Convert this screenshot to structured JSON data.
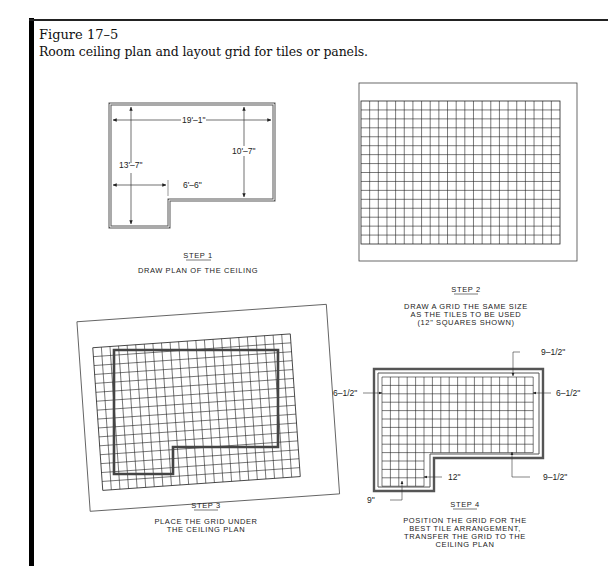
{
  "figure": {
    "number": "Figure 17–5",
    "caption": "Room ceiling plan and layout grid for tiles or panels."
  },
  "steps": [
    {
      "id": "step1",
      "title": "STEP 1",
      "description": [
        "DRAW PLAN OF THE CEILING"
      ],
      "dimensions": {
        "overall_width": "19'–1\"",
        "left_height": "13'–7\"",
        "right_height": "10'–7\"",
        "notch_width": "6'–6\""
      }
    },
    {
      "id": "step2",
      "title": "STEP 2",
      "description": [
        "DRAW A GRID THE SAME SIZE",
        "AS THE TILES TO BE USED",
        "(12\" SQUARES SHOWN)"
      ]
    },
    {
      "id": "step3",
      "title": "STEP 3",
      "description": [
        "PLACE THE GRID UNDER",
        "THE CEILING PLAN"
      ]
    },
    {
      "id": "step4",
      "title": "STEP 4",
      "description": [
        "POSITION THE GRID FOR THE",
        "BEST TILE ARRANGEMENT,",
        "TRANSFER THE GRID TO THE",
        "CEILING PLAN"
      ],
      "dimensions": {
        "top": "9–1/2\"",
        "left": "6–1/2\"",
        "right": "6–1/2\"",
        "bottom_right": "9–1/2\"",
        "tile": "12\"",
        "bottom_left": "9\""
      }
    }
  ]
}
